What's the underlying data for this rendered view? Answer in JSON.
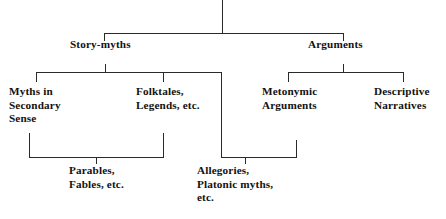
{
  "diagram": {
    "type": "tree",
    "ink_color": "#2b2a27",
    "text_color": "#13120f",
    "background": "#ffffff",
    "nodes": {
      "story_myths": "Story-myths",
      "arguments": "Arguments",
      "myths_secondary": "Myths in\nSecondary\nSense",
      "folktales": "Folktales,\nLegends, etc.",
      "metonymic": "Metonymic\nArguments",
      "descriptive": "Descriptive\nNarratives",
      "parables": "Parables,\nFables, etc.",
      "allegories": "Allegories,\nPlatonic myths,\netc."
    },
    "structure": {
      "root_children": [
        "Story-myths",
        "Arguments"
      ],
      "story_myths_children": [
        "Myths in Secondary Sense",
        "Folktales, Legends, etc."
      ],
      "arguments_children": [
        "Metonymic Arguments",
        "Descriptive Narratives"
      ],
      "bracket_parables_spans": [
        "Myths in Secondary Sense",
        "Folktales, Legends, etc."
      ],
      "bracket_allegories_spans": [
        "Folktales, Legends, etc.",
        "Metonymic Arguments"
      ]
    }
  }
}
